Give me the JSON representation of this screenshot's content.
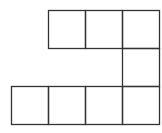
{
  "diagram": {
    "type": "grid-net",
    "cell_size": 37,
    "stroke_color": "#333333",
    "background": "#ffffff",
    "cells": [
      {
        "row": 0,
        "col": 1
      },
      {
        "row": 0,
        "col": 2
      },
      {
        "row": 0,
        "col": 3
      },
      {
        "row": 1,
        "col": 3
      },
      {
        "row": 2,
        "col": 0
      },
      {
        "row": 2,
        "col": 1
      },
      {
        "row": 2,
        "col": 2
      },
      {
        "row": 2,
        "col": 3
      }
    ],
    "origin": {
      "x": 11,
      "y": 10
    }
  }
}
